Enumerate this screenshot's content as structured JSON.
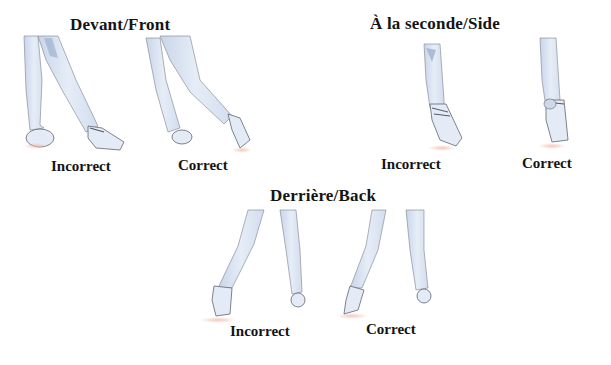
{
  "sections": [
    {
      "id": "front",
      "title": "Devant/Front",
      "panels": [
        {
          "label": "Incorrect"
        },
        {
          "label": "Correct"
        }
      ]
    },
    {
      "id": "side",
      "title": "À la seconde/Side",
      "panels": [
        {
          "label": "Incorrect"
        },
        {
          "label": "Correct"
        }
      ]
    },
    {
      "id": "back",
      "title": "Derrière/Back",
      "panels": [
        {
          "label": "Incorrect"
        },
        {
          "label": "Correct"
        }
      ]
    }
  ],
  "colors": {
    "leg_fill": "#dde6f3",
    "leg_shadow": "#b9c7de",
    "outline": "#6f7580",
    "floor_shadow": "#f2c9bf"
  }
}
